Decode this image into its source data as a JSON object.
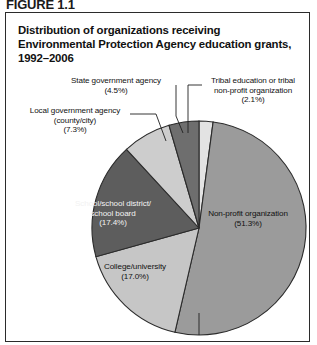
{
  "figure": {
    "number": "FIGURE 1.1",
    "title": "Distribution of organizations receiving Environmental Protection Agency education grants, 1992–2006"
  },
  "chart_data": {
    "type": "pie",
    "title": "Distribution of organizations receiving Environmental Protection Agency education grants, 1992–2006",
    "xlabel": "",
    "ylabel": "",
    "legend_position": "none",
    "grid": false,
    "units": "percent",
    "start_angle_deg": 0,
    "direction": "clockwise",
    "categories": [
      "Tribal education or tribal non-profit organization",
      "Non-profit organization",
      "College/university",
      "School/school district/school board",
      "Local government agency (county/city)",
      "State government agency"
    ],
    "values": [
      2.1,
      51.3,
      17.0,
      17.4,
      7.3,
      4.5
    ],
    "colors": [
      "#e3e3e3",
      "#9b9b9b",
      "#c6c6c6",
      "#5d5d5d",
      "#cdcdcd",
      "#6e6e6e"
    ],
    "slices": [
      {
        "name": "Tribal education or tribal non-profit organization",
        "label_line1": "Tribal education or tribal",
        "label_line2": "non-profit organization",
        "value_label": "(2.1%)",
        "value": 2.1,
        "color": "#e3e3e3",
        "label_placement": "outside"
      },
      {
        "name": "Non-profit organization",
        "label_line1": "Non-profit organization",
        "label_line2": "",
        "value_label": "(51.3%)",
        "value": 51.3,
        "color": "#9b9b9b",
        "label_placement": "inside"
      },
      {
        "name": "College/university",
        "label_line1": "College/university",
        "label_line2": "",
        "value_label": "(17.0%)",
        "value": 17.0,
        "color": "#c6c6c6",
        "label_placement": "inside"
      },
      {
        "name": "School/school district/school board",
        "label_line1": "School/school district/",
        "label_line2": "school board",
        "value_label": "(17.4%)",
        "value": 17.4,
        "color": "#5d5d5d",
        "label_placement": "inside"
      },
      {
        "name": "Local government agency (county/city)",
        "label_line1": "Local government agency",
        "label_line2": "(county/city)",
        "value_label": "(7.3%)",
        "value": 7.3,
        "color": "#cdcdcd",
        "label_placement": "outside"
      },
      {
        "name": "State government agency",
        "label_line1": "State government agency",
        "label_line2": "",
        "value_label": "(4.5%)",
        "value": 4.5,
        "color": "#6e6e6e",
        "label_placement": "outside"
      }
    ]
  },
  "style": {
    "border_color": "#2b2b2b",
    "leader_line_color": "#1f1f1f",
    "slice_outline_color": "#2b2b2b",
    "background": "#ffffff"
  }
}
